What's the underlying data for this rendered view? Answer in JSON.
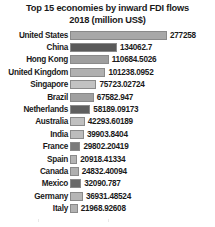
{
  "chart_data": {
    "type": "bar",
    "orientation": "horizontal",
    "title": "Top 15 economies by inward FDI flows 2018 (million US$)",
    "title_line1": "Top 15 economies by inward FDI flows",
    "title_line2": "2018 (million US$)",
    "xlabel": "",
    "ylabel": "",
    "xlim": [
      0,
      277258
    ],
    "grid": false,
    "legend": false,
    "categories": [
      "United States",
      "China",
      "Hong Kong",
      "United Kingdom",
      "Singapore",
      "Brazil",
      "Netherlands",
      "Australia",
      "India",
      "France",
      "Spain",
      "Canada",
      "Mexico",
      "Germany",
      "Italy"
    ],
    "values": [
      277258,
      134062.7,
      110684.5026,
      101238.0952,
      75723.02724,
      67582.947,
      58189.09173,
      42293.60189,
      39903.8404,
      29802.20419,
      20918.41334,
      24832.40094,
      32090.787,
      36931.48524,
      21968.92608
    ],
    "value_labels": [
      "277258",
      "134062.7",
      "110684.5026",
      "101238.0952",
      "75723.02724",
      "67582.947",
      "58189.09173",
      "42293.60189",
      "39903.8404",
      "29802.20419",
      "20918.41334",
      "24832.40094",
      "32090.787",
      "36931.48524",
      "21968.92608"
    ],
    "bar_colors": [
      "#a8a8a8",
      "#5a5a5a",
      "#9e9e9e",
      "#b0b0b0",
      "#c2c2c2",
      "#a0a0a0",
      "#5f5f5f",
      "#c0c0c0",
      "#bcbcbc",
      "#7a7a7a",
      "#b4b4b4",
      "#b0b0b0",
      "#6a6a6a",
      "#b6b6b6",
      "#b2b2b2"
    ]
  }
}
